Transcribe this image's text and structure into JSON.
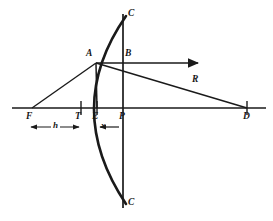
{
  "figure": {
    "stroke_color": "#1a1a1a",
    "background_color": "#ffffff",
    "labels": {
      "focus": "F",
      "tangent_vertex": "T",
      "foot_of_ordinate": "E",
      "pole": "P",
      "center_of_curvature": "D",
      "curve_point": "A",
      "axis_intercept": "B",
      "aperture_top": "C",
      "aperture_bottom": "C",
      "radius": "R",
      "height_dimension": "h",
      "depth_dimension": "x"
    }
  },
  "geometry": {
    "optical_axis": {
      "x1": 12,
      "y1": 108,
      "x2": 266,
      "y2": 108
    },
    "aperture_line": {
      "x1": 123,
      "y1": 14,
      "x2": 123,
      "y2": 208
    },
    "points": {
      "F": {
        "x": 32,
        "y": 108
      },
      "T": {
        "x": 81,
        "y": 108
      },
      "E": {
        "x": 97,
        "y": 108
      },
      "P": {
        "x": 123,
        "y": 108
      },
      "D": {
        "x": 247,
        "y": 108
      },
      "A": {
        "x": 96,
        "y": 63
      },
      "B": {
        "x": 123,
        "y": 63
      }
    },
    "rays": {
      "focus_to_A": {
        "x1": 32,
        "y1": 108,
        "x2": 96,
        "y2": 63
      },
      "A_to_D": {
        "x1": 96,
        "y1": 63,
        "x2": 247,
        "y2": 108
      },
      "reflected_horizontal": {
        "x1": 96,
        "y1": 63,
        "x2": 200,
        "y2": 63
      },
      "ordinate_A_to_E": {
        "x1": 96,
        "y1": 63,
        "x2": 97,
        "y2": 108
      }
    },
    "parabola": {
      "vertex_x": 81,
      "vertex_y": 108,
      "top_x": 126,
      "top_y": 16,
      "bottom_x": 126,
      "bottom_y": 204
    },
    "dimension_h": {
      "x1": 30,
      "x2": 80,
      "y": 127
    },
    "dimension_x": {
      "x1": 118,
      "x2": 99,
      "y": 127
    }
  },
  "label_positions": {
    "F": {
      "x": 26,
      "y": 112
    },
    "T": {
      "x": 75,
      "y": 112
    },
    "E": {
      "x": 92,
      "y": 112
    },
    "P": {
      "x": 119,
      "y": 112
    },
    "D": {
      "x": 243,
      "y": 112
    },
    "A": {
      "x": 86,
      "y": 49
    },
    "B": {
      "x": 125,
      "y": 49
    },
    "C_top": {
      "x": 128,
      "y": 9
    },
    "C_bottom": {
      "x": 128,
      "y": 198
    },
    "R": {
      "x": 192,
      "y": 75
    },
    "h": {
      "x": 51,
      "y": 121
    },
    "x": {
      "x": 101,
      "y": 121
    }
  }
}
